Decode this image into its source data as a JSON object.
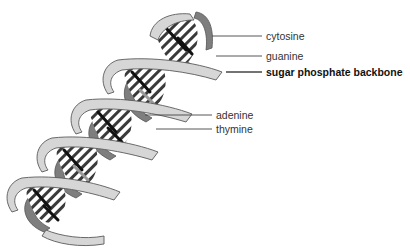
{
  "diagram": {
    "colors": {
      "backbone_light": "#d4d4d4",
      "backbone_dark": "#7a7a7a",
      "outline": "#555555",
      "base_black": "#1a1a1a",
      "base_grey": "#9a9a9a",
      "base_white": "#ffffff",
      "leader_line": "#444444",
      "background": "#ffffff"
    },
    "labels": [
      {
        "id": "cytosine",
        "text": "cytosine",
        "bold": false,
        "x": 266,
        "y": 30
      },
      {
        "id": "guanine",
        "text": "guanine",
        "bold": false,
        "x": 266,
        "y": 50
      },
      {
        "id": "backbone",
        "text": "sugar phosphate backbone",
        "bold": true,
        "x": 266,
        "y": 66
      },
      {
        "id": "adenine",
        "text": "adenine",
        "bold": false,
        "x": 216,
        "y": 109
      },
      {
        "id": "thymine",
        "text": "thymine",
        "bold": false,
        "x": 216,
        "y": 123
      }
    ],
    "leader_lines": [
      {
        "for": "cytosine",
        "x1": 212,
        "y1": 36,
        "x2": 262,
        "y2": 36
      },
      {
        "for": "guanine",
        "x1": 216,
        "y1": 56,
        "x2": 262,
        "y2": 56
      },
      {
        "for": "backbone",
        "x1": 228,
        "y1": 72,
        "x2": 262,
        "y2": 72
      },
      {
        "for": "adenine",
        "x1": 145,
        "y1": 115,
        "x2": 212,
        "y2": 115
      },
      {
        "for": "thymine",
        "x1": 156,
        "y1": 129,
        "x2": 212,
        "y2": 129
      }
    ]
  }
}
